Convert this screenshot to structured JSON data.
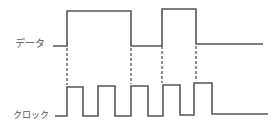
{
  "diagram": {
    "type": "timing-diagram",
    "signals": [
      {
        "name": "data",
        "label": "データ",
        "low_y": 46,
        "high_y": 11,
        "path": "M53,46 L67,46 L67,11 L131,11 L131,46 L162,46 L162,9 L196,9 L196,44 L263,44"
      },
      {
        "name": "clock",
        "label": "クロック",
        "low_y": 116,
        "high_y": 86,
        "path": "M55,116 L67,116 L67,87 L83,87 L83,116 L98,116 L98,86 L115,86 L115,116 L131,116 L131,86 L148,86 L148,116 L163,116 L163,85 L180,85 L180,115 L194,115 L194,83 L212,83 L212,114 L268,114"
      }
    ],
    "dashed_guides": [
      {
        "x": 67,
        "y1": 48,
        "y2": 85
      },
      {
        "x": 131,
        "y1": 48,
        "y2": 84
      },
      {
        "x": 162,
        "y1": 46,
        "y2": 83
      },
      {
        "x": 196,
        "y1": 46,
        "y2": 81
      }
    ],
    "stroke_color": "#555555"
  }
}
